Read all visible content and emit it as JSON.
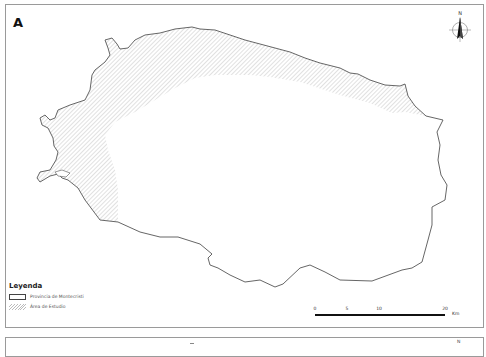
{
  "panels": [
    {
      "label": "A",
      "legend": {
        "title": "Leyenda",
        "items": [
          {
            "symbol": "outline",
            "label": "Provincia de Montecristi"
          },
          {
            "symbol": "hatch",
            "label": "Área de Estudio"
          }
        ]
      },
      "scale_bar": {
        "ticks": [
          "0",
          "5",
          "10",
          "20"
        ],
        "unit": "Km"
      },
      "north_arrow": {
        "label": "N"
      }
    },
    {
      "label": "",
      "north_arrow": {
        "label": "N"
      }
    }
  ],
  "colors": {
    "outline": "#555555",
    "hatch": "#bbbbbb",
    "frame": "#9a9a9a"
  }
}
